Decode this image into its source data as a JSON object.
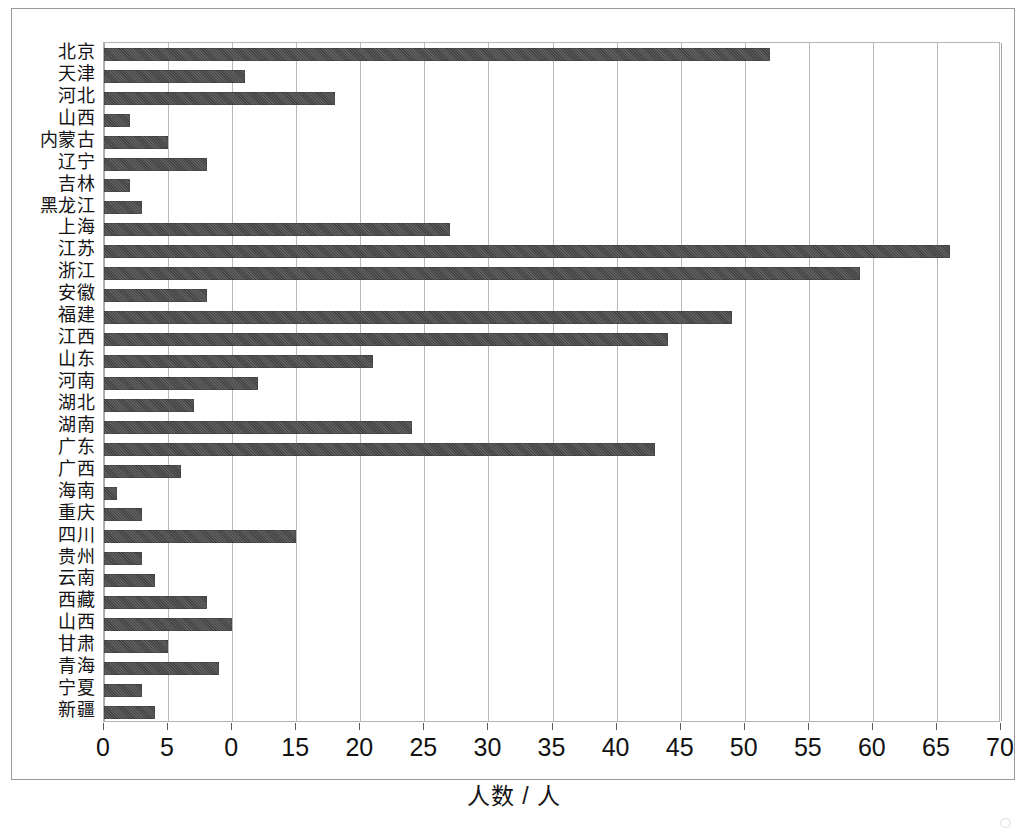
{
  "chart_data": {
    "type": "bar",
    "orientation": "horizontal",
    "title": "",
    "xlabel": "人数 / 人",
    "ylabel": "",
    "xlim": [
      0,
      70
    ],
    "xticks": [
      0,
      5,
      10,
      15,
      20,
      25,
      30,
      35,
      40,
      45,
      50,
      55,
      60,
      65,
      70
    ],
    "xtick_labels": [
      "0",
      "5",
      "0",
      "15",
      "20",
      "25",
      "30",
      "35",
      "40",
      "45",
      "50",
      "55",
      "60",
      "65",
      "70"
    ],
    "grid": true,
    "grid_axis": "x",
    "legend": null,
    "bar_color": "#4d4d4d",
    "categories": [
      "北京",
      "天津",
      "河北",
      "山西",
      "内蒙古",
      "辽宁",
      "吉林",
      "黑龙江",
      "上海",
      "江苏",
      "浙江",
      "安徽",
      "福建",
      "江西",
      "山东",
      "河南",
      "湖北",
      "湖南",
      "广东",
      "广西",
      "海南",
      "重庆",
      "四川",
      "贵州",
      "云南",
      "西藏",
      "山西",
      "甘肃",
      "青海",
      "宁夏",
      "新疆"
    ],
    "values": [
      52,
      11,
      18,
      2,
      5,
      8,
      2,
      3,
      27,
      66,
      59,
      8,
      49,
      44,
      21,
      12,
      7,
      24,
      43,
      6,
      1,
      3,
      15,
      3,
      4,
      8,
      10,
      5,
      9,
      3,
      4
    ]
  }
}
